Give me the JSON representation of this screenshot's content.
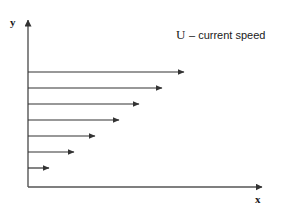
{
  "figure": {
    "background_color": "#ffffff",
    "stroke_color": "#333333",
    "text_color": "#1a1a1a"
  },
  "axes": {
    "y_axis": {
      "label": "y",
      "x": 28,
      "y_top": 18,
      "y_bottom": 187
    },
    "x_axis": {
      "label": "x",
      "y": 187,
      "x_left": 28,
      "x_right": 265
    }
  },
  "legend": {
    "symbol": "U",
    "dash": "–",
    "description": "current speed",
    "full_text": "U – current speed"
  },
  "chart_data": {
    "type": "bar",
    "title": "",
    "subtitle": "",
    "xlabel": "x",
    "ylabel": "y",
    "orientation": "horizontal",
    "grid": false,
    "legend_position": "top-right",
    "series_name": "U – current speed",
    "annotations": [
      "U – current speed"
    ],
    "categories": [
      "y7",
      "y6",
      "y5",
      "y4",
      "y3",
      "y2",
      "y1"
    ],
    "values": [
      162,
      140,
      117,
      97,
      73,
      52,
      27
    ],
    "xlim": [
      0,
      237
    ],
    "ylim": [
      0,
      169
    ],
    "arrows": [
      {
        "index": 1,
        "y": 72,
        "x_start": 28,
        "x_tip": 190,
        "length": 162
      },
      {
        "index": 2,
        "y": 88,
        "x_start": 28,
        "x_tip": 168,
        "length": 140
      },
      {
        "index": 3,
        "y": 104,
        "x_start": 28,
        "x_tip": 145,
        "length": 117
      },
      {
        "index": 4,
        "y": 120,
        "x_start": 28,
        "x_tip": 125,
        "length": 97
      },
      {
        "index": 5,
        "y": 136,
        "x_start": 28,
        "x_tip": 101,
        "length": 73
      },
      {
        "index": 6,
        "y": 152,
        "x_start": 28,
        "x_tip": 80,
        "length": 52
      },
      {
        "index": 7,
        "y": 168,
        "x_start": 28,
        "x_tip": 55,
        "length": 27
      }
    ]
  }
}
